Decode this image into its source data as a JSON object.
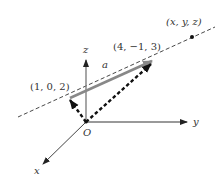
{
  "figure": {
    "type": "3d-vector-line-diagram",
    "axes": {
      "x": {
        "label": "x"
      },
      "y": {
        "label": "y"
      },
      "z": {
        "label": "z"
      }
    },
    "origin": {
      "label": "O"
    },
    "points": [
      {
        "id": "p1",
        "label": "(1, 0, 2)"
      },
      {
        "id": "p2",
        "label": "(4, −1, 3)"
      },
      {
        "id": "p3",
        "label": "(x, y, z)"
      }
    ],
    "vector": {
      "label": "a",
      "from": "(1, 0, 2)",
      "to": "(4, −1, 3)"
    },
    "colors": {
      "axis": "#777777",
      "vector_a": "#888888",
      "dashed_line": "#333333",
      "position_vectors": "#111111",
      "text": "#333333"
    }
  }
}
